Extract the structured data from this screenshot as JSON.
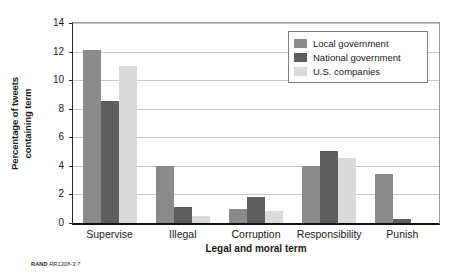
{
  "chart_data": {
    "type": "bar",
    "title": "",
    "xlabel": "Legal and moral term",
    "ylabel": "Percentage of tweets containing term",
    "ylabel_lines": [
      "Percentage of tweets",
      "containing term"
    ],
    "categories": [
      "Supervise",
      "Illegal",
      "Corruption",
      "Responsibility",
      "Punish"
    ],
    "series": [
      {
        "name": "Local government",
        "color": "#8a8a8a",
        "values": [
          12.1,
          4.0,
          1.0,
          4.0,
          3.45
        ]
      },
      {
        "name": "National government",
        "color": "#5e5e5e",
        "values": [
          8.55,
          1.15,
          1.8,
          5.05,
          0.3
        ]
      },
      {
        "name": "U.S. companies",
        "color": "#dadada",
        "values": [
          11.0,
          0.5,
          0.85,
          4.55,
          0.0
        ]
      }
    ],
    "ylim": [
      0,
      14
    ],
    "yticks": [
      0,
      2,
      4,
      6,
      8,
      10,
      12,
      14
    ],
    "ytick_labels": [
      "0",
      "2",
      "4",
      "6",
      "8",
      "10",
      "12",
      "14"
    ],
    "grid": "horizontal",
    "legend_position": "top-right"
  },
  "legend": {
    "entries": [
      {
        "label": "Local government"
      },
      {
        "label": "National government"
      },
      {
        "label": "U.S. companies"
      }
    ]
  },
  "source": {
    "org": "RAND",
    "figure_id": "RR1308-3.7"
  }
}
